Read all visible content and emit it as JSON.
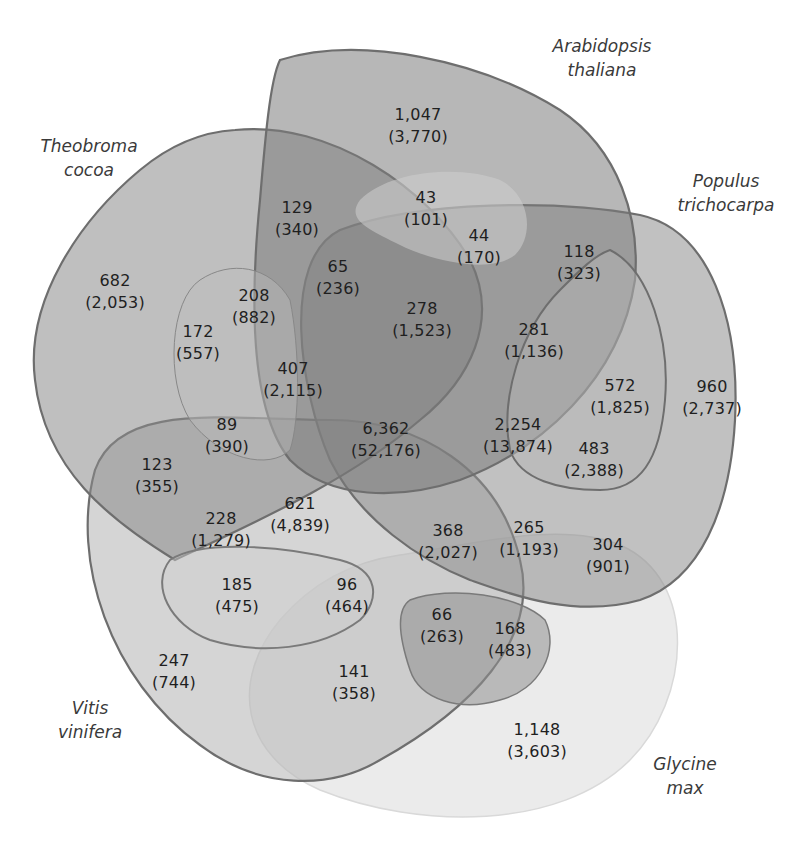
{
  "diagram": {
    "type": "five-set-venn",
    "colors": {
      "arabidopsis": "#8c8c8c",
      "theobroma": "#a3a3a3",
      "populus": "#9a9a9a",
      "vitis": "#c4c4c4",
      "glycine": "#ececec",
      "outline": "#6e6e6e",
      "text": "#1f1f1f"
    },
    "species": [
      {
        "id": "arabidopsis",
        "line1": "Arabidopsis",
        "line2": "thaliana"
      },
      {
        "id": "theobroma",
        "line1": "Theobroma",
        "line2": "cocoa"
      },
      {
        "id": "populus",
        "line1": "Populus",
        "line2": "trichocarpa"
      },
      {
        "id": "vitis",
        "line1": "Vitis",
        "line2": "vinifera"
      },
      {
        "id": "glycine",
        "line1": "Glycine",
        "line2": "max"
      }
    ],
    "regions": [
      {
        "count": "1,047",
        "total": "(3,770)"
      },
      {
        "count": "43",
        "total": "(101)"
      },
      {
        "count": "129",
        "total": "(340)"
      },
      {
        "count": "44",
        "total": "(170)"
      },
      {
        "count": "118",
        "total": "(323)"
      },
      {
        "count": "682",
        "total": "(2,053)"
      },
      {
        "count": "65",
        "total": "(236)"
      },
      {
        "count": "208",
        "total": "(882)"
      },
      {
        "count": "172",
        "total": "(557)"
      },
      {
        "count": "278",
        "total": "(1,523)"
      },
      {
        "count": "281",
        "total": "(1,136)"
      },
      {
        "count": "407",
        "total": "(2,115)"
      },
      {
        "count": "572",
        "total": "(1,825)"
      },
      {
        "count": "960",
        "total": "(2,737)"
      },
      {
        "count": "89",
        "total": "(390)"
      },
      {
        "count": "6,362",
        "total": "(52,176)"
      },
      {
        "count": "2,254",
        "total": "(13,874)"
      },
      {
        "count": "483",
        "total": "(2,388)"
      },
      {
        "count": "123",
        "total": "(355)"
      },
      {
        "count": "621",
        "total": "(4,839)"
      },
      {
        "count": "228",
        "total": "(1,279)"
      },
      {
        "count": "368",
        "total": "(2,027)"
      },
      {
        "count": "265",
        "total": "(1,193)"
      },
      {
        "count": "304",
        "total": "(901)"
      },
      {
        "count": "185",
        "total": "(475)"
      },
      {
        "count": "96",
        "total": "(464)"
      },
      {
        "count": "66",
        "total": "(263)"
      },
      {
        "count": "168",
        "total": "(483)"
      },
      {
        "count": "247",
        "total": "(744)"
      },
      {
        "count": "141",
        "total": "(358)"
      },
      {
        "count": "1,148",
        "total": "(3,603)"
      }
    ]
  }
}
